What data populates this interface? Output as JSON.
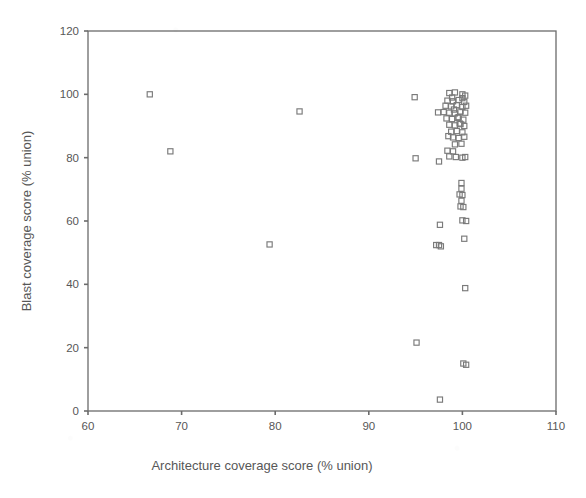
{
  "chart_data": {
    "type": "scatter",
    "title": "",
    "xlabel": "Architecture coverage score (% union)",
    "ylabel": "Blast coverage score (% union)",
    "xlim": [
      60,
      110
    ],
    "ylim": [
      0,
      120
    ],
    "xticks": [
      60,
      70,
      80,
      90,
      100,
      110
    ],
    "yticks": [
      0,
      20,
      40,
      60,
      80,
      100,
      120
    ],
    "xtick_labels": [
      "60",
      "70",
      "80",
      "90",
      "100",
      "110"
    ],
    "ytick_labels": [
      "0",
      "20",
      "40",
      "60",
      "80",
      "100",
      "120"
    ],
    "grid": false,
    "legend": null,
    "marker": "open-square",
    "marker_color": "#7a7a7a",
    "n_points": 73,
    "points": [
      [
        66.6,
        100.0
      ],
      [
        68.8,
        82.0
      ],
      [
        82.6,
        94.6
      ],
      [
        79.4,
        52.6
      ],
      [
        94.9,
        99.1
      ],
      [
        95.0,
        79.8
      ],
      [
        95.1,
        21.6
      ],
      [
        97.4,
        94.3
      ],
      [
        97.5,
        78.8
      ],
      [
        97.6,
        58.8
      ],
      [
        97.2,
        52.4
      ],
      [
        97.5,
        52.4
      ],
      [
        97.7,
        52.0
      ],
      [
        97.6,
        3.6
      ],
      [
        98.6,
        100.4
      ],
      [
        99.2,
        100.6
      ],
      [
        100.0,
        100.0
      ],
      [
        100.3,
        99.6
      ],
      [
        98.4,
        98.0
      ],
      [
        99.0,
        97.8
      ],
      [
        99.6,
        98.2
      ],
      [
        100.2,
        97.6
      ],
      [
        98.2,
        96.4
      ],
      [
        98.8,
        96.2
      ],
      [
        99.4,
        96.6
      ],
      [
        100.0,
        96.0
      ],
      [
        100.4,
        96.4
      ],
      [
        98.0,
        94.4
      ],
      [
        98.6,
        94.2
      ],
      [
        99.2,
        94.0
      ],
      [
        99.8,
        94.6
      ],
      [
        100.3,
        94.2
      ],
      [
        98.3,
        92.4
      ],
      [
        98.9,
        92.2
      ],
      [
        99.5,
        92.6
      ],
      [
        100.1,
        92.0
      ],
      [
        98.6,
        90.4
      ],
      [
        99.2,
        90.2
      ],
      [
        99.8,
        90.6
      ],
      [
        100.2,
        90.0
      ],
      [
        98.8,
        88.2
      ],
      [
        99.4,
        88.4
      ],
      [
        100.0,
        88.0
      ],
      [
        99.0,
        86.4
      ],
      [
        99.6,
        86.2
      ],
      [
        100.2,
        86.6
      ],
      [
        99.2,
        84.2
      ],
      [
        99.9,
        84.4
      ],
      [
        98.4,
        82.2
      ],
      [
        99.0,
        82.0
      ],
      [
        98.6,
        80.4
      ],
      [
        99.3,
        80.2
      ],
      [
        100.0,
        80.0
      ],
      [
        100.3,
        80.2
      ],
      [
        99.9,
        72.0
      ],
      [
        99.9,
        70.2
      ],
      [
        99.7,
        68.4
      ],
      [
        100.0,
        68.2
      ],
      [
        99.9,
        66.4
      ],
      [
        99.8,
        64.6
      ],
      [
        100.1,
        64.4
      ],
      [
        100.0,
        60.2
      ],
      [
        100.4,
        60.0
      ],
      [
        100.2,
        54.4
      ],
      [
        100.3,
        38.8
      ],
      [
        100.1,
        15.0
      ],
      [
        100.4,
        14.6
      ],
      [
        99.6,
        92.8
      ],
      [
        99.1,
        95.2
      ],
      [
        98.9,
        99.0
      ],
      [
        99.7,
        90.8
      ],
      [
        100.0,
        98.8
      ],
      [
        98.5,
        86.8
      ]
    ]
  }
}
